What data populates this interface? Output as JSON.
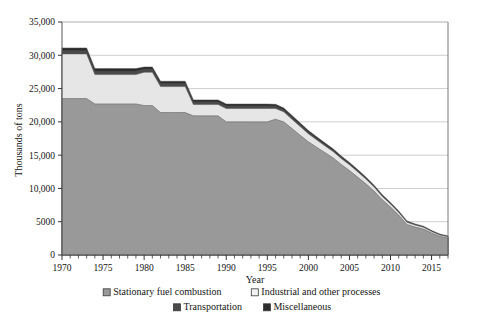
{
  "chart_data": {
    "type": "area",
    "title": "",
    "xlabel": "Year",
    "ylabel": "Thousands of tons",
    "stacked": true,
    "grid": true,
    "legend_position": "bottom",
    "xlim": [
      1970,
      2017
    ],
    "ylim": [
      0,
      35000
    ],
    "ytick_values": [
      0,
      5000,
      10000,
      15000,
      20000,
      25000,
      30000,
      35000
    ],
    "ytick_labels": [
      "0",
      "5000",
      "10,000",
      "15,000",
      "20,000",
      "25,000",
      "30,000",
      "35,000"
    ],
    "xtick_labels": [
      "1970",
      "1975",
      "1980",
      "1985",
      "1990",
      "1995",
      "2000",
      "2005",
      "2010",
      "2015"
    ],
    "xtick_values": [
      1970,
      1975,
      1980,
      1985,
      1990,
      1995,
      2000,
      2005,
      2010,
      2015
    ],
    "xminor_step": 1,
    "x": [
      1970,
      1971,
      1972,
      1973,
      1974,
      1975,
      1976,
      1977,
      1978,
      1979,
      1980,
      1981,
      1982,
      1983,
      1984,
      1985,
      1986,
      1987,
      1988,
      1989,
      1990,
      1991,
      1992,
      1993,
      1994,
      1995,
      1996,
      1997,
      1998,
      1999,
      2000,
      2001,
      2002,
      2003,
      2004,
      2005,
      2006,
      2007,
      2008,
      2009,
      2010,
      2011,
      2012,
      2013,
      2014,
      2015,
      2016,
      2017
    ],
    "series": [
      {
        "name": "Stationary fuel combustion",
        "color": "#999999",
        "values": [
          23500,
          23500,
          23500,
          23500,
          22700,
          22700,
          22700,
          22700,
          22700,
          22700,
          22450,
          22450,
          21400,
          21400,
          21400,
          21400,
          20900,
          20900,
          20900,
          20900,
          20000,
          20000,
          20000,
          20000,
          20000,
          20000,
          20400,
          20000,
          19000,
          18000,
          17000,
          16200,
          15400,
          14600,
          13600,
          12700,
          11700,
          10700,
          9600,
          8300,
          7200,
          6000,
          4600,
          4200,
          3900,
          3300,
          2800,
          2550
        ]
      },
      {
        "name": "Industrial and other processes",
        "color": "#e6e6e6",
        "values": [
          6700,
          6700,
          6700,
          6700,
          4400,
          4400,
          4400,
          4400,
          4400,
          4400,
          5000,
          5000,
          3900,
          3900,
          3900,
          3900,
          1700,
          1700,
          1700,
          1700,
          2000,
          2000,
          2000,
          2000,
          2000,
          2000,
          1600,
          1500,
          1400,
          1300,
          1200,
          1100,
          1000,
          950,
          900,
          850,
          800,
          700,
          600,
          500,
          450,
          400,
          320,
          290,
          270,
          230,
          200,
          180
        ]
      },
      {
        "name": "Transportation",
        "color": "#4a4a4a",
        "values": [
          500,
          500,
          500,
          500,
          500,
          500,
          500,
          500,
          500,
          500,
          450,
          450,
          450,
          450,
          450,
          450,
          400,
          400,
          400,
          400,
          380,
          380,
          380,
          380,
          380,
          380,
          350,
          330,
          310,
          290,
          270,
          250,
          230,
          210,
          190,
          170,
          150,
          130,
          120,
          110,
          100,
          90,
          80,
          70,
          65,
          60,
          55,
          50
        ]
      },
      {
        "name": "Miscellaneous",
        "color": "#2b2b2b",
        "values": [
          400,
          400,
          400,
          400,
          400,
          400,
          400,
          400,
          400,
          400,
          350,
          350,
          350,
          350,
          350,
          350,
          300,
          300,
          300,
          300,
          300,
          300,
          300,
          300,
          300,
          300,
          280,
          270,
          260,
          250,
          240,
          230,
          220,
          210,
          200,
          190,
          180,
          170,
          160,
          150,
          140,
          130,
          120,
          110,
          100,
          95,
          90,
          85
        ]
      }
    ],
    "totals_note": ""
  },
  "legend": {
    "items": [
      {
        "label": "Stationary fuel combustion",
        "color": "#999999",
        "marker": "legend-swatch-stationary"
      },
      {
        "label": "Industrial and other processes",
        "color": "#f2f2f2",
        "marker": "legend-swatch-industrial"
      },
      {
        "label": "Transportation",
        "color": "#4a4a4a",
        "marker": "legend-swatch-transportation"
      },
      {
        "label": "Miscellaneous",
        "color": "#2b2b2b",
        "marker": "legend-swatch-miscellaneous"
      }
    ]
  }
}
